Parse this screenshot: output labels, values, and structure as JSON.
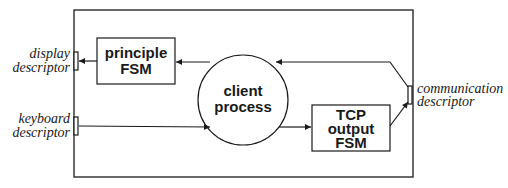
{
  "diagram": {
    "type": "block-diagram",
    "colors": {
      "stroke": "#1a1a1a",
      "background": "#ffffff"
    },
    "nodes": {
      "principle_fsm": {
        "line1": "principle",
        "line2": "FSM"
      },
      "client_process": {
        "line1": "client",
        "line2": "process"
      },
      "tcp_output_fsm": {
        "line1": "TCP",
        "line2": "output",
        "line3": "FSM"
      }
    },
    "ports": {
      "display": {
        "line1": "display",
        "line2": "descriptor"
      },
      "keyboard": {
        "line1": "keyboard",
        "line2": "descriptor"
      },
      "communication": {
        "line1": "communication",
        "line2": "descriptor"
      }
    },
    "edges": [
      {
        "from": "client process",
        "to": "principle FSM"
      },
      {
        "from": "principle FSM",
        "to": "display descriptor"
      },
      {
        "from": "keyboard descriptor",
        "to": "client process"
      },
      {
        "from": "client process",
        "to": "TCP output FSM"
      },
      {
        "from": "TCP output FSM",
        "to": "communication descriptor"
      },
      {
        "from": "communication descriptor",
        "to": "client process"
      }
    ]
  }
}
